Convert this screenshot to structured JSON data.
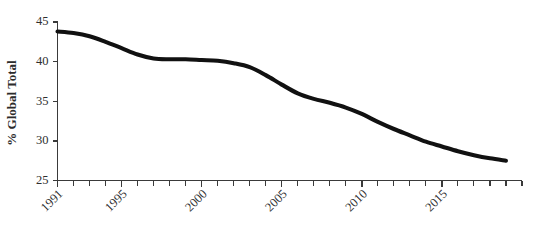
{
  "chart_data": {
    "type": "line",
    "title": "",
    "xlabel": "",
    "ylabel": "% Global Total",
    "xlim": [
      1991,
      2020
    ],
    "ylim": [
      25,
      45
    ],
    "grid": false,
    "legend": false,
    "y_ticks": [
      25,
      30,
      35,
      40,
      45
    ],
    "x_ticks": [
      1991,
      1992,
      1993,
      1994,
      1995,
      1996,
      1997,
      1998,
      1999,
      2000,
      2001,
      2002,
      2003,
      2004,
      2005,
      2006,
      2007,
      2008,
      2009,
      2010,
      2011,
      2012,
      2013,
      2014,
      2015,
      2016,
      2017,
      2018,
      2019,
      2020
    ],
    "x_tick_labels": [
      "1991",
      "1995",
      "2000",
      "2005",
      "2010",
      "2015"
    ],
    "x_tick_label_years": [
      1991,
      1995,
      2000,
      2005,
      2010,
      2015
    ],
    "series": [
      {
        "name": "% Global Total",
        "color": "#111111",
        "x": [
          1991,
          1992,
          1993,
          1994,
          1995,
          1996,
          1997,
          1998,
          1999,
          2000,
          2001,
          2002,
          2003,
          2004,
          2005,
          2006,
          2007,
          2008,
          2009,
          2010,
          2011,
          2012,
          2013,
          2014,
          2015,
          2016,
          2017,
          2018,
          2019
        ],
        "values": [
          43.8,
          43.6,
          43.2,
          42.5,
          41.7,
          40.9,
          40.4,
          40.3,
          40.3,
          40.2,
          40.1,
          39.8,
          39.3,
          38.3,
          37.1,
          36.0,
          35.3,
          34.8,
          34.2,
          33.4,
          32.4,
          31.5,
          30.7,
          29.9,
          29.3,
          28.7,
          28.2,
          27.8,
          27.5
        ]
      }
    ]
  },
  "axis": {
    "y_title": "% Global Total"
  }
}
